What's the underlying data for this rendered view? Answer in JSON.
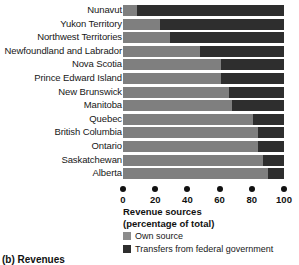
{
  "caption": "(b) Revenues",
  "axis_title": {
    "line1": "Revenue sources",
    "line2": "(percentage of total)"
  },
  "legend": {
    "items": [
      {
        "label": "Own source",
        "color": "#8c8c8c",
        "key": "own"
      },
      {
        "label": "Transfers from federal government",
        "color": "#2e2e2e",
        "key": "transfer"
      }
    ]
  },
  "colors": {
    "own_source": "#7f7f7f",
    "transfers": "#2e2e2e",
    "axis": "#111111",
    "background": "#ffffff"
  },
  "chart_data": {
    "type": "bar",
    "orientation": "horizontal",
    "stacked": true,
    "title": "",
    "xlabel": "Revenue sources (percentage of total)",
    "ylabel": "",
    "xlim": [
      0,
      100
    ],
    "xticks": [
      0,
      20,
      40,
      60,
      80,
      100
    ],
    "xtick_labels": [
      "0",
      "20",
      "40",
      "60",
      "80",
      "100"
    ],
    "grid": false,
    "legend_position": "below-axis-left",
    "categories": [
      "Nunavut",
      "Yukon Territory",
      "Northwest Territories",
      "Newfoundland and Labrador",
      "Nova Scotia",
      "Prince Edward Island",
      "New Brunswick",
      "Manitoba",
      "Quebec",
      "British Columbia",
      "Ontario",
      "Saskatchewan",
      "Alberta"
    ],
    "series": [
      {
        "name": "Own source",
        "color": "#7f7f7f",
        "values": [
          9,
          23,
          29,
          48,
          61,
          61,
          66,
          68,
          81,
          84,
          84,
          87,
          90
        ]
      },
      {
        "name": "Transfers from federal government",
        "color": "#2e2e2e",
        "values": [
          91,
          77,
          71,
          52,
          39,
          39,
          34,
          32,
          19,
          16,
          16,
          13,
          10
        ]
      }
    ]
  }
}
